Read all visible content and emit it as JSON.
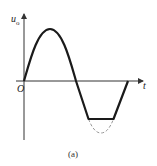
{
  "figure": {
    "caption": "(a)",
    "y_axis_label": "u",
    "y_axis_subscript": "o",
    "x_axis_label": "t",
    "origin_label": "O"
  },
  "waveform": {
    "description": "One period of a sine wave whose negative half-cycle is clipped flat; the unclipped portion of the trough is drawn dashed",
    "period_px": 104,
    "amplitude_px": 52,
    "clip_level_fraction": -0.73,
    "colors": {
      "curve": "#1a1a1a",
      "axes": "#333333",
      "dashed": "#999999"
    }
  }
}
